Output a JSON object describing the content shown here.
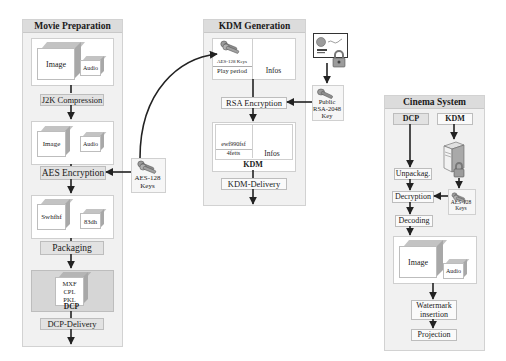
{
  "movie_preparation": {
    "title": "Movie Preparation",
    "image_label": "Image",
    "audio_label": "Audio",
    "step1": "J2K Compression",
    "image2_label": "Image",
    "audio2_label": "Audio",
    "step2": "AES Encryption",
    "enc_image_label": "Swhfhf",
    "enc_audio_label": "83dh",
    "step3": "Packaging",
    "dcp_files": [
      "MXF",
      "CPL",
      "PKL"
    ],
    "dcp_label": "DCP",
    "step4": "DCP-Delivery"
  },
  "aes_keys_left": {
    "line1": "AES-128",
    "line2": "Keys"
  },
  "kdm_generation": {
    "title": "KDM Generation",
    "keys_label": "AES-128 Keys",
    "play_period": "Play period",
    "infos": "Infos",
    "step1": "RSA Encryption",
    "enc_line1": "ewf990fsf",
    "enc_line2": "4fetts",
    "infos2": "Infos",
    "kdm_label": "KDM",
    "step2": "KDM-Delivery"
  },
  "public_key": {
    "line1": "Public",
    "line2": "RSA-2048",
    "line3": "Key"
  },
  "cinema_system": {
    "title": "Cinema System",
    "dcp_input": "DCP",
    "kdm_input": "KDM",
    "unpack": "Unpackag.",
    "decrypt": "Decryption",
    "decode": "Decoding",
    "keys_line1": "AES-128",
    "keys_line2": "Keys",
    "image_label": "Image",
    "audio_label": "Audio",
    "watermark_line1": "Watermark",
    "watermark_line2": "insertion",
    "projection": "Projection"
  }
}
